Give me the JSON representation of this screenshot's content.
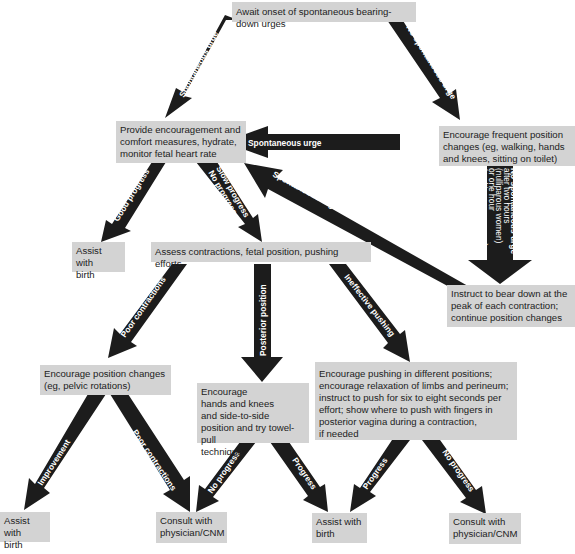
{
  "boxes": {
    "await": "Await onset of spontaneous bearing-down urges",
    "provide": "Provide encouragement and\ncomfort measures, hydrate,\nmonitor fetal heart rate",
    "encourage_frequent": "Encourage frequent position\nchanges (eg, walking, hands\nand knees, sitting on toilet)",
    "assist_top": "Assist with\nbirth",
    "assess": "Assess contractions, fetal position, pushing efforts",
    "instruct": "Instruct to bear down at the\npeak of each contraction;\ncontinue position changes",
    "encourage_pelvic": "Encourage position changes\n(eg, pelvic rotations)",
    "encourage_hands": "Encourage\nhands and knees\nand side-to-side\nposition and try towel-pull\ntechnique",
    "encourage_pushing": "Encourage pushing in different positions;\nencourage relaxation of limbs and perineum;\ninstruct to push for six to eight seconds per\neffort; show where to push with fingers in\nposterior vagina during a contraction,\nif needed",
    "assist_left": "Assist with\nbirth",
    "consult_left": "Consult with\nphysician/CNM",
    "assist_mid": "Assist with\nbirth",
    "consult_right": "Consult with\nphysician/CNM"
  },
  "arrows": {
    "spontaneous_urge_1": "Spontaneous urge",
    "no_spontaneous_urge": "No spontaneous urge",
    "spontaneous_urge_2": "Spontaneous urge",
    "spontaneous_urge_3": "Spontaneous urge",
    "no_urge_after_hours": [
      "No spontaneous urge",
      "after two hours",
      "(nulliparous women)",
      "or one hour",
      "(multiparous women)"
    ],
    "good_progress": "Good progress",
    "slow_progress": [
      "Slow progress",
      "No progress"
    ],
    "poor_contractions_1": "Poor contractions",
    "posterior_position": "Posterior position",
    "ineffective_pushing": "Ineffective pushing",
    "improvement": "Improvement",
    "poor_contractions_2": "Poor contractions",
    "no_progress_1": "No progress",
    "progress_1": "Progress",
    "progress_2": "Progress",
    "no_progress_2": "No progress"
  },
  "colors": {
    "box_fill": "#d3d3d3",
    "arrow_fill": "#1c1c1c",
    "arrow_text": "#ffffff"
  }
}
